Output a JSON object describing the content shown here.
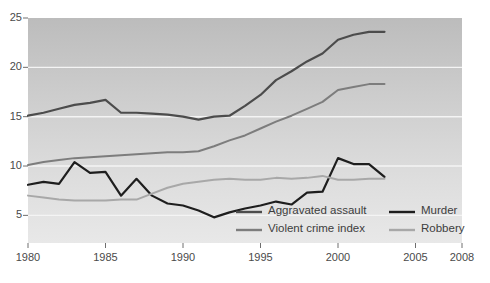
{
  "chart_data": {
    "type": "line",
    "title": "",
    "subtitle": "",
    "xlabel": "",
    "ylabel": "",
    "xlim": [
      1980,
      2008
    ],
    "ylim": [
      2.2,
      25
    ],
    "grid": "horizontal white gridlines at 5, 10, 15, 20",
    "legend_position": "inside bottom-center, two columns",
    "background": "vertical gray gradient, dark at top to light at bottom",
    "x": [
      1980,
      1981,
      1982,
      1983,
      1984,
      1985,
      1986,
      1987,
      1988,
      1989,
      1990,
      1991,
      1992,
      1993,
      1994,
      1995,
      1996,
      1997,
      1998,
      1999,
      2000,
      2001,
      2002,
      2003
    ],
    "yticks": [
      5,
      10,
      15,
      20,
      25
    ],
    "ytick_labels": [
      "5",
      "10",
      "15",
      "20",
      "25"
    ],
    "xticks": [
      1980,
      1985,
      1990,
      1995,
      2000,
      2005,
      2008
    ],
    "xtick_labels": [
      "1980",
      "1985",
      "1990",
      "1995",
      "2000",
      "2005",
      "2008"
    ],
    "series": [
      {
        "name": "Aggravated assault",
        "color": "#4c4c4c",
        "width": 2.2,
        "values": [
          15.1,
          15.4,
          15.8,
          16.2,
          16.4,
          16.7,
          15.4,
          15.4,
          15.3,
          15.2,
          15.0,
          14.7,
          15.0,
          15.1,
          16.1,
          17.2,
          18.7,
          19.6,
          20.6,
          21.4,
          22.8,
          23.3,
          23.6,
          23.6
        ]
      },
      {
        "name": "Murder",
        "color": "#1e1e1e",
        "width": 2.2,
        "values": [
          8.1,
          8.4,
          8.2,
          10.4,
          9.3,
          9.4,
          7.0,
          8.7,
          7.0,
          6.2,
          6.0,
          5.5,
          4.8,
          5.3,
          5.7,
          6.0,
          6.4,
          6.1,
          7.3,
          7.4,
          10.8,
          10.2,
          10.2,
          8.9
        ]
      },
      {
        "name": "Violent crime index",
        "color": "#7d7d7d",
        "width": 2.0,
        "values": [
          10.1,
          10.4,
          10.6,
          10.8,
          10.9,
          11.0,
          11.1,
          11.2,
          11.3,
          11.4,
          11.4,
          11.5,
          12.0,
          12.6,
          13.1,
          13.8,
          14.5,
          15.1,
          15.8,
          16.5,
          17.7,
          18.0,
          18.3,
          18.3
        ]
      },
      {
        "name": "Robbery",
        "color": "#a8a8a8",
        "width": 2.0,
        "values": [
          7.0,
          6.8,
          6.6,
          6.5,
          6.5,
          6.5,
          6.6,
          6.6,
          7.2,
          7.8,
          8.2,
          8.4,
          8.6,
          8.7,
          8.6,
          8.6,
          8.8,
          8.7,
          8.8,
          9.0,
          8.6,
          8.6,
          8.7,
          8.7
        ]
      }
    ],
    "legend": [
      {
        "label": "Aggravated assault",
        "color": "#4c4c4c"
      },
      {
        "label": "Murder",
        "color": "#1e1e1e"
      },
      {
        "label": "Violent crime index",
        "color": "#7d7d7d"
      },
      {
        "label": "Robbery",
        "color": "#a8a8a8"
      }
    ]
  }
}
